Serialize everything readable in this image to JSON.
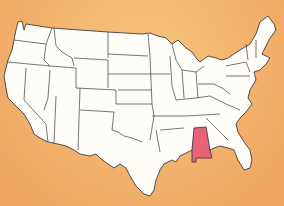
{
  "map": {
    "title": "United States map with Alabama highlighted",
    "highlighted_state": "Alabama",
    "colors": {
      "background": "#f2b06a",
      "land": "#fdfcf6",
      "borders": "#3d3d45",
      "highlight": "#e8637a"
    }
  }
}
